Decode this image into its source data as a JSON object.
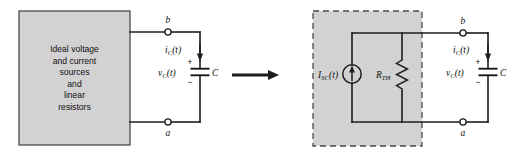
{
  "figure": {
    "colors": {
      "box_fill": "#d2d2d2",
      "box_stroke": "#4a4a4a",
      "wire": "#1c1c1c",
      "text": "#101010",
      "node_fill": "#ffffff"
    }
  },
  "left_circuit": {
    "source_box": {
      "lines": [
        "Ideal voltage",
        "and current",
        "sources",
        "and",
        "linear",
        "resistors"
      ]
    },
    "terminals": {
      "top_label": "b",
      "bottom_label": "a"
    },
    "capacitor": {
      "current_label": "i",
      "current_sub": "C",
      "current_arg": "(t)",
      "voltage_label": "v",
      "voltage_sub": "C",
      "voltage_arg": "(t)",
      "plus_sign": "+",
      "minus_sign": "−",
      "component_label": "C"
    }
  },
  "transform_arrow": {
    "name": "implies-arrow"
  },
  "right_circuit": {
    "equivalent_box": {
      "style": "dashed"
    },
    "current_source": {
      "label": "I",
      "label_sub": "SC",
      "label_arg": "(t)",
      "direction": "up"
    },
    "resistor": {
      "label": "R",
      "label_sub": "TH"
    },
    "terminals": {
      "top_label": "b",
      "bottom_label": "a"
    },
    "capacitor": {
      "current_label": "i",
      "current_sub": "C",
      "current_arg": "(t)",
      "voltage_label": "v",
      "voltage_sub": "C",
      "voltage_arg": "(t)",
      "plus_sign": "+",
      "minus_sign": "−",
      "component_label": "C"
    }
  }
}
